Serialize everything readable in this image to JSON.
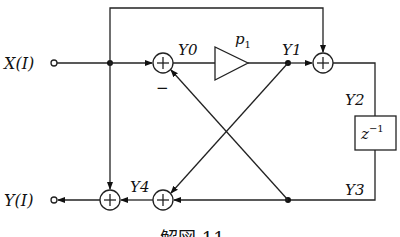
{
  "diagram": {
    "input_label": "X(I)",
    "output_label": "Y(I)",
    "signals": {
      "y0": "Y0",
      "y1": "Y1",
      "y2": "Y2",
      "y3": "Y3",
      "y4": "Y4"
    },
    "gain_label": "p",
    "gain_subscript": "1",
    "delay_label": "z",
    "delay_superscript": "−1",
    "minus_sign": "−",
    "caption": "解図 11"
  }
}
